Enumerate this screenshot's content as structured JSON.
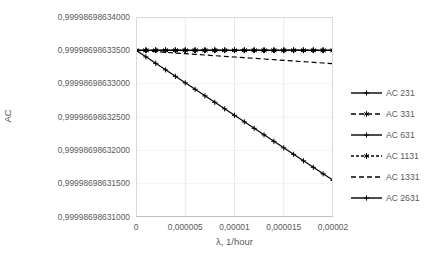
{
  "chart_data": {
    "type": "line",
    "title": "",
    "xlabel": "λ, 1/hour",
    "ylabel": "AC",
    "grid": true,
    "legend_position": "right",
    "xlim": [
      0,
      2e-05
    ],
    "ylim": [
      0.99998698631,
      0.99998698634
    ],
    "x_tick_labels": [
      "0",
      "0,000005",
      "0,00001",
      "0,000015",
      "0,00002"
    ],
    "x_ticks": [
      0,
      5e-06,
      1e-05,
      1.5e-05,
      2e-05
    ],
    "y_tick_labels": [
      "0,99998698634000",
      "0,99998698633500",
      "0,99998698633000",
      "0,99998698632500",
      "0,99998698632000",
      "0,99998698631500",
      "0,99998698631000"
    ],
    "y_ticks": [
      0.99998698634,
      0.999986986335,
      0.99998698633,
      0.999986986325,
      0.99998698632,
      0.999986986315,
      0.99998698631
    ],
    "x": [
      0,
      1e-06,
      2e-06,
      3e-06,
      4e-06,
      5e-06,
      6e-06,
      7e-06,
      8e-06,
      9e-06,
      1e-05,
      1.1e-05,
      1.2e-05,
      1.3e-05,
      1.4e-05,
      1.5e-05,
      1.6e-05,
      1.7e-05,
      1.8e-05,
      1.9e-05,
      2e-05
    ],
    "series": [
      {
        "name": "AC 231",
        "style": "solid",
        "marker": "plus",
        "color": "#000000",
        "values": [
          0.999986986335,
          0.999986986335,
          0.999986986335,
          0.999986986335,
          0.999986986335,
          0.999986986335,
          0.999986986335,
          0.999986986335,
          0.999986986335,
          0.999986986335,
          0.999986986335,
          0.999986986335,
          0.999986986335,
          0.999986986335,
          0.999986986335,
          0.999986986335,
          0.999986986335,
          0.999986986335,
          0.999986986335,
          0.999986986335,
          0.999986986335
        ]
      },
      {
        "name": "AC 331",
        "style": "dashed",
        "marker": "asterisk",
        "color": "#000000",
        "values": [
          0.999986986335,
          0.999986986335,
          0.999986986335,
          0.999986986335,
          0.999986986335,
          0.999986986335,
          0.999986986335,
          0.999986986335,
          0.999986986335,
          0.999986986335,
          0.999986986335,
          0.999986986335,
          0.999986986335,
          0.999986986335,
          0.999986986335,
          0.999986986335,
          0.999986986335,
          0.999986986335,
          0.999986986335,
          0.999986986335,
          0.999986986335
        ]
      },
      {
        "name": "AC 631",
        "style": "solid",
        "marker": "plus",
        "color": "#000000",
        "values": [
          0.999986986335,
          0.999986986335,
          0.999986986335,
          0.999986986335,
          0.999986986335,
          0.999986986335,
          0.999986986335,
          0.999986986335,
          0.999986986335,
          0.999986986335,
          0.999986986335,
          0.999986986335,
          0.999986986335,
          0.999986986335,
          0.999986986335,
          0.999986986335,
          0.999986986335,
          0.999986986335,
          0.999986986335,
          0.999986986335,
          0.999986986335
        ]
      },
      {
        "name": "AC 1131",
        "style": "dashed-fine",
        "marker": "asterisk",
        "color": "#000000",
        "values": [
          0.999986986335,
          0.999986986335,
          0.999986986335,
          0.999986986335,
          0.999986986335,
          0.999986986335,
          0.999986986335,
          0.999986986335,
          0.999986986335,
          0.999986986335,
          0.999986986335,
          0.999986986335,
          0.999986986335,
          0.999986986335,
          0.999986986335,
          0.999986986335,
          0.999986986335,
          0.999986986335,
          0.999986986335,
          0.999986986335,
          0.999986986335
        ]
      },
      {
        "name": "AC 1331",
        "style": "dashed",
        "marker": "none",
        "color": "#000000",
        "values": [
          0.999986986335,
          0.9999869863349,
          0.9999869863348,
          0.9999869863347,
          0.9999869863346,
          0.9999869863345,
          0.9999869863344,
          0.9999869863343,
          0.9999869863342,
          0.9999869863341,
          0.999986986334,
          0.9999869863339,
          0.9999869863338,
          0.9999869863337,
          0.9999869863336,
          0.9999869863335,
          0.9999869863334,
          0.9999869863333,
          0.9999869863332,
          0.9999869863331,
          0.999986986333
        ]
      },
      {
        "name": "AC 2631",
        "style": "solid",
        "marker": "plus",
        "color": "#000000",
        "values": [
          0.999986986335,
          0.99998698633402,
          0.99998698633305,
          0.99998698633207,
          0.9999869863311,
          0.99998698633012,
          0.99998698632915,
          0.99998698632817,
          0.9999869863272,
          0.99998698632622,
          0.99998698632525,
          0.99998698632427,
          0.9999869863233,
          0.99998698632232,
          0.99998698632135,
          0.99998698632037,
          0.9999869863194,
          0.99998698631842,
          0.99998698631745,
          0.99998698631647,
          0.9999869863155
        ]
      }
    ]
  }
}
